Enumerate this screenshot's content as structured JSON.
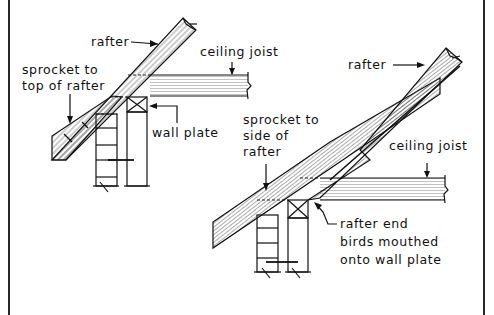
{
  "figure": {
    "left_detail": {
      "labels": {
        "rafter": "rafter",
        "ceiling_joist": "ceiling joist",
        "sprocket_line1": "sprocket to",
        "sprocket_line2": "top of rafter",
        "wall_plate": "wall plate"
      }
    },
    "right_detail": {
      "labels": {
        "rafter": "rafter",
        "ceiling_joist": "ceiling joist",
        "sprocket_line1": "sprocket to",
        "sprocket_line2": "side of",
        "sprocket_line3": "rafter",
        "note_line1": "rafter end",
        "note_line2": "birds mouthed",
        "note_line3": "onto wall plate"
      }
    },
    "colors": {
      "ink": "#111111",
      "background": "#ffffff"
    }
  }
}
